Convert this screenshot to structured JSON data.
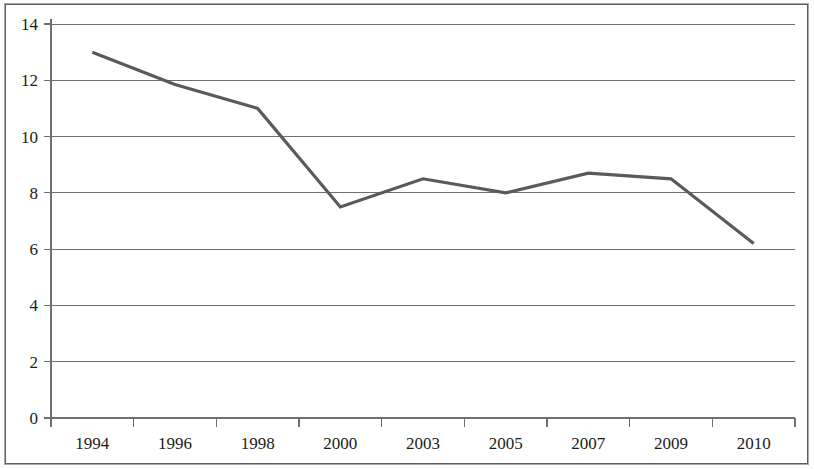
{
  "chart_data": {
    "type": "line",
    "title": "",
    "subtitle": "",
    "xlabel": "",
    "ylabel": "",
    "categories": [
      "1994",
      "1996",
      "1998",
      "2000",
      "2003",
      "2005",
      "2007",
      "2009",
      "2010"
    ],
    "series": [
      {
        "name": "",
        "values": [
          13.0,
          11.85,
          11.0,
          7.5,
          8.5,
          8.0,
          8.7,
          8.5,
          6.2
        ]
      }
    ],
    "ylim": [
      0,
      14
    ],
    "ytick_labels": [
      "0",
      "2",
      "4",
      "6",
      "8",
      "10",
      "12",
      "14"
    ],
    "ytick_values": [
      0,
      2,
      4,
      6,
      8,
      10,
      12,
      14
    ],
    "xtick_labels": [
      "1994",
      "1996",
      "1998",
      "2000",
      "2003",
      "2005",
      "2007",
      "2009",
      "2010"
    ],
    "grid": "horizontal",
    "legend": "none",
    "annotations": [],
    "colors": {
      "line": "#5a5a5a",
      "grid": "#6f6f6f",
      "axis": "#6f6f6f",
      "frame": "#5d5d5d",
      "text": "#1b1b1b",
      "background": "#ffffff"
    }
  }
}
